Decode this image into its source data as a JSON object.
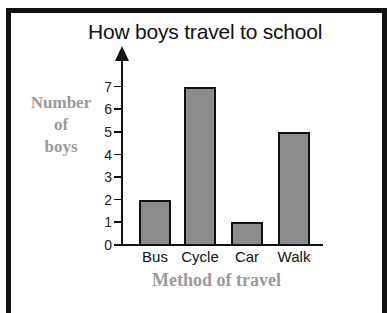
{
  "chart_data": {
    "type": "bar",
    "title": "How boys travel to school",
    "xlabel": "Method of travel",
    "ylabel": "Number of boys",
    "ylabel_lines": [
      "Number",
      "of",
      "boys"
    ],
    "categories": [
      "Bus",
      "Cycle",
      "Car",
      "Walk"
    ],
    "values": [
      2,
      7,
      1,
      5
    ],
    "ylim": [
      0,
      7
    ],
    "yticks": [
      "0",
      "1",
      "2",
      "3",
      "4",
      "5",
      "6",
      "7"
    ],
    "grid": false,
    "legend": null,
    "colors": {
      "bar_fill": "#8c8c8c",
      "bar_edge": "#111111",
      "label_gray": "#9a9a9a"
    }
  }
}
